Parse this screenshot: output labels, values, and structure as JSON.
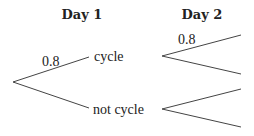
{
  "headers": {
    "day1": "Day 1",
    "day2": "Day 2"
  },
  "tree": {
    "level1": [
      {
        "outcome": "cycle",
        "probability": "0.8"
      },
      {
        "outcome": "not cycle",
        "probability": ""
      }
    ],
    "level2": {
      "after_cycle": [
        {
          "outcome": "",
          "probability": "0.8"
        },
        {
          "outcome": "",
          "probability": ""
        }
      ],
      "after_not_cycle": [
        {
          "outcome": "",
          "probability": ""
        },
        {
          "outcome": "",
          "probability": ""
        }
      ]
    }
  },
  "colors": {
    "line": "#444444",
    "text": "#222222"
  }
}
